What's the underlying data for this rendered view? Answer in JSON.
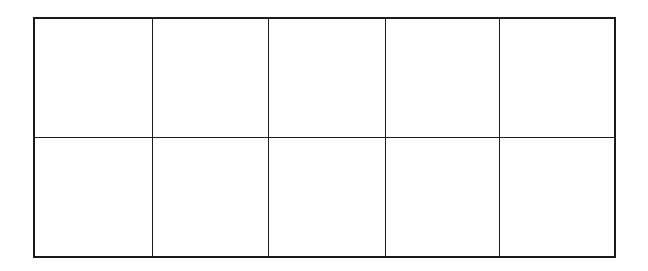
{
  "diagram": {
    "type": "ten-frame",
    "rows": 2,
    "columns": 5,
    "line_color": "#1a1a1a",
    "background_color": "#ffffff",
    "cells": [
      [
        "",
        "",
        "",
        "",
        ""
      ],
      [
        "",
        "",
        "",
        "",
        ""
      ]
    ]
  }
}
